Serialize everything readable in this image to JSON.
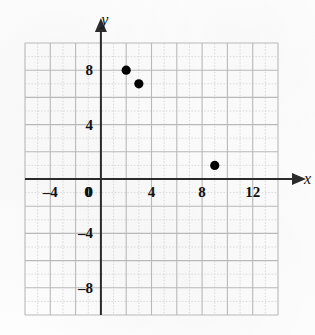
{
  "chart_data": {
    "type": "scatter",
    "title": "",
    "xlabel": "x",
    "ylabel": "y",
    "xlim": [
      -6,
      14
    ],
    "ylim": [
      -10,
      10
    ],
    "grid": true,
    "major_grid_step": 2,
    "minor_grid_step": 1,
    "legend": "none",
    "x_ticks": [
      -4,
      0,
      4,
      8,
      12
    ],
    "x_tick_labels": [
      "–4",
      "0",
      "4",
      "8",
      "12"
    ],
    "y_ticks": [
      8,
      4,
      0,
      -4,
      -8
    ],
    "y_tick_labels": [
      "8",
      "4",
      "0",
      "–4",
      "–8"
    ],
    "points": [
      {
        "x": 2,
        "y": 8
      },
      {
        "x": 3,
        "y": 7
      },
      {
        "x": 9,
        "y": 1
      }
    ],
    "point_color": "#000000",
    "axis_color": "#2b2b2b",
    "major_grid_color": "#b9b9b9",
    "minor_grid_color": "#d9d9d9"
  },
  "figure": {
    "background_color": "#fdfdfd",
    "x_axis_arrow": true,
    "y_axis_arrow": true
  }
}
